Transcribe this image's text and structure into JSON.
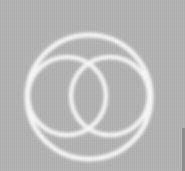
{
  "image": {
    "description": "Three glowing white rings on gray background: one large outer ring enclosing two overlapping inner rings",
    "background_color": "#b3b3b3",
    "ring_color": "#f4f4f4",
    "edge_strip_color": "#8e8e8e",
    "rings": [
      {
        "name": "outer-ring",
        "cx": 89,
        "cy": 97,
        "r": 62
      },
      {
        "name": "inner-left-ring",
        "cx": 67,
        "cy": 96,
        "r": 39
      },
      {
        "name": "inner-right-ring",
        "cx": 110,
        "cy": 96,
        "r": 39
      }
    ]
  }
}
